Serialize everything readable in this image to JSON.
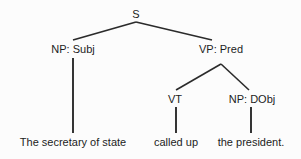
{
  "diagram": {
    "type": "syntax-tree",
    "sentence": "The secretary of state called up the president.",
    "background_color": "#fcfcfc",
    "text_color": "#1d1d1d",
    "line_color": "#2b2b2b",
    "nodes": {
      "root": {
        "label": "S",
        "x": 136,
        "y": 18
      },
      "np_subj": {
        "label": "NP: Subj",
        "x": 73,
        "y": 53
      },
      "vp_pred": {
        "label": "VP: Pred",
        "x": 221,
        "y": 53
      },
      "vt": {
        "label": "VT",
        "x": 175,
        "y": 103
      },
      "np_dobj": {
        "label": "NP: DObj",
        "x": 252,
        "y": 103
      }
    },
    "leaves": {
      "subject": {
        "label": "The secretary of state",
        "x": 73,
        "y": 146
      },
      "verb": {
        "label": "called up",
        "x": 176,
        "y": 146
      },
      "object": {
        "label": "the president.",
        "x": 251,
        "y": 146
      }
    },
    "edges": [
      {
        "name": "s-to-np-subj",
        "points": "73,40 136,22"
      },
      {
        "name": "s-to-vp-pred",
        "points": "136,22 212,40"
      },
      {
        "name": "np-subj-to-subject",
        "points": "73,58 73,133"
      },
      {
        "name": "vp-to-vt",
        "points": "176,90 221,64"
      },
      {
        "name": "vp-to-np-dobj",
        "points": "221,64 249,90"
      },
      {
        "name": "vt-to-verb",
        "points": "176,107 176,133"
      },
      {
        "name": "np-dobj-to-object",
        "points": "251,107 251,133"
      }
    ]
  }
}
